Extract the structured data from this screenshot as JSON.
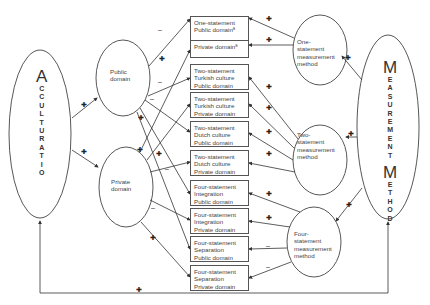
{
  "latent_constructs": {
    "acculturation": {
      "first": "A",
      "rest": [
        "C",
        "C",
        "U",
        "L",
        "T",
        "U",
        "R",
        "A",
        "T",
        "I",
        "O",
        "N"
      ]
    },
    "measurement_method": {
      "word1_first": "M",
      "word1_rest": [
        "E",
        "A",
        "S",
        "U",
        "R",
        "E",
        "M",
        "E",
        "N",
        "T"
      ],
      "word2_first": "M",
      "word2_rest": [
        "E",
        "T",
        "H",
        "O",
        "D"
      ]
    }
  },
  "domain_factors": {
    "public": [
      "Public",
      "domain"
    ],
    "private": [
      "Private",
      "domain"
    ]
  },
  "method_factors": {
    "one_statement": [
      "One-",
      "statement",
      "measurement",
      "method"
    ],
    "two_statement": [
      "Two-",
      "statement",
      "measurement",
      "method"
    ],
    "four_statement": [
      "Four-",
      "statement",
      "measurement",
      "method"
    ]
  },
  "indicators": [
    {
      "lines": [
        "One-statement",
        "Public domainª"
      ]
    },
    {
      "lines": [
        "Private domainª"
      ]
    },
    {
      "lines": [
        "Two-statement",
        "Turkish culture",
        "Public domain"
      ]
    },
    {
      "lines": [
        "Two-statement",
        "Turkish culture",
        "Private domain"
      ]
    },
    {
      "lines": [
        "Two-statement",
        "Dutch culture",
        "Public domain"
      ]
    },
    {
      "lines": [
        "Two-statement",
        "Dutch culture",
        "Private domain"
      ]
    },
    {
      "lines": [
        "Four-statement",
        "Integration",
        "Public domain"
      ]
    },
    {
      "lines": [
        "Four-statement",
        "Integration",
        "Private domain"
      ]
    },
    {
      "lines": [
        "Four-statement",
        "Separation",
        "Public domain"
      ]
    },
    {
      "lines": [
        "Four-statement",
        "Separation",
        "Private domain"
      ]
    }
  ],
  "signs": {
    "plus": "✚",
    "minus": "–"
  },
  "colors": {
    "line": "#333333",
    "text": "#444444",
    "background": "#ffffff"
  }
}
